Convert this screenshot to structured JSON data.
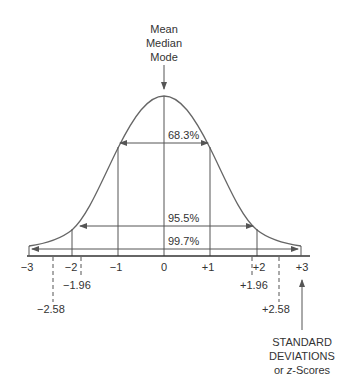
{
  "header": {
    "lines": [
      "Mean",
      "Median",
      "Mode"
    ]
  },
  "intervals": [
    {
      "label": "68.3%",
      "from": -1,
      "to": 1
    },
    {
      "label": "95.5%",
      "from": -1.96,
      "to": 1.96
    },
    {
      "label": "99.7%",
      "from": -3,
      "to": 3
    }
  ],
  "axis": {
    "ticks": [
      "−3",
      "−2",
      "−1",
      "0",
      "+1",
      "+2",
      "+3"
    ],
    "dashed": [
      {
        "label": "−1.96",
        "value": -1.96
      },
      {
        "label": "−2.58",
        "value": -2.58
      },
      {
        "label": "+1.96",
        "value": 1.96
      },
      {
        "label": "+2.58",
        "value": 2.58
      }
    ]
  },
  "footer": {
    "line1": "STANDARD",
    "line2": "DEVIATIONS",
    "line3_prefix": "or ",
    "line3_italic": "z",
    "line3_suffix": "-Scores"
  },
  "colors": {
    "stroke": "#555555",
    "text": "#333333"
  }
}
